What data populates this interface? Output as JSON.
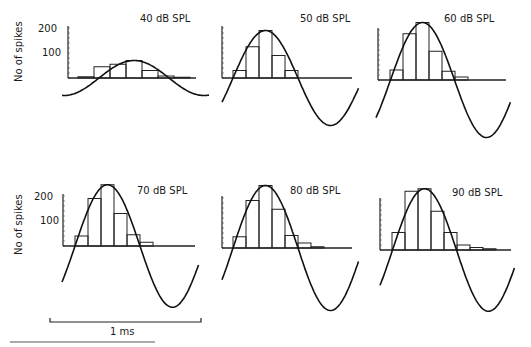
{
  "figure": {
    "y_axis_label": "No of spikes",
    "scale_bar_label": "1 ms",
    "tick_labels": [
      "200",
      "100"
    ]
  },
  "chart_data": {
    "type": "bar",
    "ylabel": "No of spikes",
    "xlabel": "",
    "scale_bar": "1 ms",
    "ylim": [
      0,
      200
    ],
    "yticks": [
      100,
      200
    ],
    "grid": false,
    "panels": [
      {
        "title": "40 dB SPL",
        "bins": [
          5,
          45,
          55,
          70,
          30,
          8,
          3
        ],
        "sine_amplitude": 70
      },
      {
        "title": "50 dB SPL",
        "bins": [
          30,
          125,
          190,
          90,
          30
        ],
        "sine_amplitude": 190
      },
      {
        "title": "60 dB SPL",
        "bins": [
          40,
          185,
          230,
          115,
          35,
          12
        ],
        "sine_amplitude": 230
      },
      {
        "title": "70 dB SPL",
        "bins": [
          40,
          190,
          245,
          130,
          45,
          15
        ],
        "sine_amplitude": 245
      },
      {
        "title": "80 dB SPL",
        "bins": [
          45,
          190,
          250,
          155,
          50,
          20,
          5
        ],
        "sine_amplitude": 250
      },
      {
        "title": "90 dB SPL",
        "bins": [
          70,
          235,
          245,
          155,
          70,
          20,
          10,
          5
        ],
        "sine_amplitude": 245
      }
    ]
  }
}
